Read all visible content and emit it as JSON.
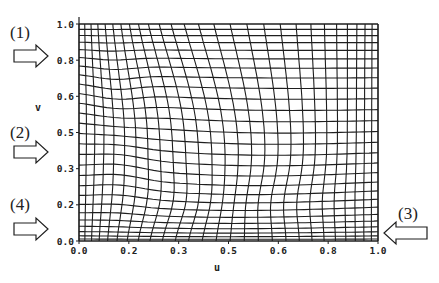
{
  "figure": {
    "plot_box": {
      "left": 79,
      "top": 24,
      "right": 378,
      "bottom": 241
    },
    "x_axis": {
      "label": "u",
      "ticks": [
        {
          "value": 0.0,
          "label": "0.0"
        },
        {
          "value": 0.1667,
          "label": "0.2"
        },
        {
          "value": 0.3333,
          "label": "0.3"
        },
        {
          "value": 0.5,
          "label": "0.5"
        },
        {
          "value": 0.6667,
          "label": "0.6"
        },
        {
          "value": 0.8333,
          "label": "0.8"
        },
        {
          "value": 1.0,
          "label": "1.0"
        }
      ]
    },
    "y_axis": {
      "label": "v",
      "ticks": [
        {
          "value": 0.0,
          "label": "0.0"
        },
        {
          "value": 0.1667,
          "label": "0.2"
        },
        {
          "value": 0.3333,
          "label": "0.3"
        },
        {
          "value": 0.5,
          "label": "0.5"
        },
        {
          "value": 0.6667,
          "label": "0.6"
        },
        {
          "value": 0.8333,
          "label": "0.8"
        },
        {
          "value": 1.0,
          "label": "1.0"
        }
      ]
    },
    "mesh": {
      "columns": 27,
      "rows": 27,
      "line_color": "#1e1e1e"
    },
    "callouts": [
      {
        "id": "1",
        "label": "(1)",
        "direction": "right",
        "side": "left",
        "v_approx": 0.85
      },
      {
        "id": "2",
        "label": "(2)",
        "direction": "right",
        "side": "left",
        "v_approx": 0.41
      },
      {
        "id": "4",
        "label": "(4)",
        "direction": "right",
        "side": "left",
        "v_approx": 0.05
      },
      {
        "id": "3",
        "label": "(3)",
        "direction": "left",
        "side": "right",
        "v_approx": 0.03
      }
    ]
  }
}
